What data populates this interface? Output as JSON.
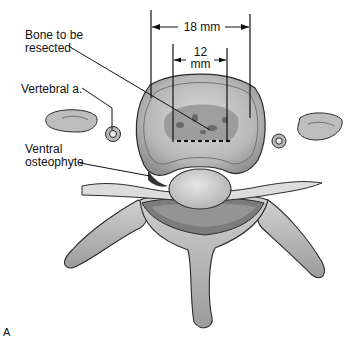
{
  "figure": {
    "panel_label": "A",
    "labels": {
      "bone_resected_line1": "Bone to be",
      "bone_resected_line2": "resected",
      "vertebral_artery": "Vertebral a.",
      "ventral_line1": "Ventral",
      "ventral_line2": "osteophyte"
    },
    "dimensions": {
      "outer": "18 mm",
      "inner_value": "12",
      "inner_unit": "mm"
    },
    "colors": {
      "bone_fill": "#c9c9c9",
      "bone_dark": "#8a8a8a",
      "outline": "#2a2a2a",
      "text": "#111111",
      "background": "#ffffff"
    }
  }
}
